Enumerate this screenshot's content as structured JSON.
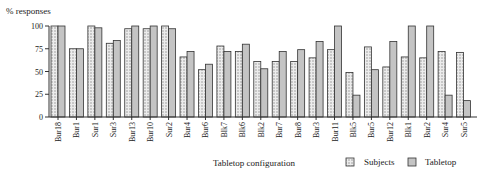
{
  "chart_data": {
    "type": "bar",
    "title": "",
    "ylabel": "% responses",
    "xlabel": "Tabletop configuration",
    "ylim": [
      0,
      100
    ],
    "yticks": [
      0,
      25,
      50,
      75,
      100
    ],
    "grid": false,
    "legend_position": "bottom-right",
    "categories": [
      "Bur18",
      "Bur1",
      "Sur1",
      "Sur3",
      "Bur13",
      "Bur10",
      "Sur2",
      "Bur4",
      "Bur6",
      "Blk7",
      "Blk6",
      "Blk2",
      "Bur7",
      "Bur8",
      "Bur3",
      "Bur11",
      "Blk5",
      "Bur5",
      "Bur12",
      "Blk1",
      "Bur2",
      "Sur4",
      "Sur5"
    ],
    "series": [
      {
        "name": "Subjects",
        "pattern": "dotted",
        "values": [
          100,
          75,
          100,
          81,
          97,
          97,
          100,
          66,
          52,
          78,
          72,
          61,
          61,
          61,
          65,
          74,
          49,
          77,
          55,
          66,
          65,
          72,
          71
        ]
      },
      {
        "name": "Tabletop",
        "pattern": "gray",
        "values": [
          100,
          75,
          98,
          84,
          100,
          100,
          97,
          72,
          58,
          72,
          80,
          53,
          72,
          74,
          83,
          100,
          24,
          52,
          83,
          100,
          100,
          24,
          18
        ]
      }
    ]
  },
  "legend": {
    "subjects_label": "Subjects",
    "tabletop_label": "Tabletop"
  },
  "axis": {
    "y_title": "% responses",
    "x_title": "Tabletop configuration"
  },
  "colors": {
    "subjects_fill": "#ebebeb",
    "subjects_dot": "#9a9a9a",
    "tabletop_fill": "#c4c4c4",
    "stroke": "#333333"
  }
}
